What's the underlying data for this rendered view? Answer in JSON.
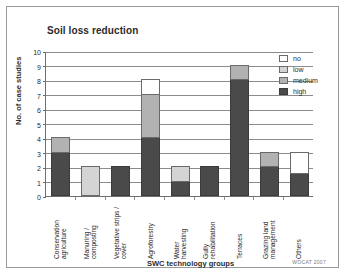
{
  "figure": {
    "credit": "WOCAT 2007"
  },
  "chart_data": {
    "type": "bar",
    "subtype": "stacked-bar",
    "title": "Soil loss reduction",
    "xlabel": "SWC technology groups",
    "ylabel": "No. of case studies",
    "ylim": [
      0,
      10
    ],
    "yticks": [
      0,
      1,
      2,
      3,
      4,
      5,
      6,
      7,
      8,
      9,
      10
    ],
    "grid": "horizontal",
    "legend_position": "top-right",
    "stack_order_bottom_to_top": [
      "high",
      "medium",
      "low",
      "no"
    ],
    "colors": {
      "no": "#ffffff",
      "low": "#d4d4d4",
      "medium": "#b2b2b2",
      "high": "#4a4a4a"
    },
    "categories": [
      "Conservation agriculture",
      "Manuring / composting",
      "Vegetative strips / cover",
      "Agroforestry",
      "Water harvesting",
      "Gully rehabilitation",
      "Terraces",
      "Grazing land management",
      "Others"
    ],
    "series": [
      {
        "name": "high",
        "values": [
          3,
          0,
          2,
          4,
          1,
          2,
          8,
          2,
          1.5
        ]
      },
      {
        "name": "medium",
        "values": [
          1,
          0,
          0,
          3,
          0,
          0,
          1,
          1,
          0
        ]
      },
      {
        "name": "low",
        "values": [
          0,
          2,
          0,
          0,
          1,
          0,
          0,
          0,
          0
        ]
      },
      {
        "name": "no",
        "values": [
          0,
          0,
          0,
          1,
          0,
          0,
          0,
          0,
          1.5
        ]
      }
    ],
    "totals": [
      4,
      2,
      2,
      8,
      2,
      2,
      9,
      3,
      3
    ],
    "legend": [
      {
        "key": "no",
        "label": "no"
      },
      {
        "key": "low",
        "label": "low"
      },
      {
        "key": "medium",
        "label": "medium"
      },
      {
        "key": "high",
        "label": "high"
      }
    ]
  }
}
